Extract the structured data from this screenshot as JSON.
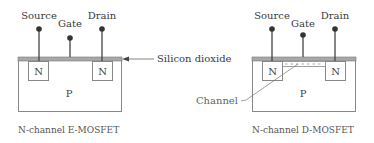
{
  "diagrams": [
    {
      "id": "e-mosfet",
      "caption": "N-channel E-MOSFET",
      "terminals": {
        "source": "Source",
        "gate": "Gate",
        "drain": "Drain"
      },
      "regions": {
        "left_n": "N",
        "right_n": "N",
        "substrate": "P"
      }
    },
    {
      "id": "d-mosfet",
      "caption": "N-channel D-MOSFET",
      "terminals": {
        "source": "Source",
        "gate": "Gate",
        "drain": "Drain"
      },
      "regions": {
        "left_n": "N",
        "right_n": "N",
        "substrate": "P"
      },
      "channel_label": "Channel"
    }
  ],
  "callouts": {
    "oxide": "Silicon dioxide"
  },
  "colors": {
    "oxide": "#9a9a9a",
    "lines": "#555555",
    "terminal": "#333333",
    "box": "#888888"
  }
}
